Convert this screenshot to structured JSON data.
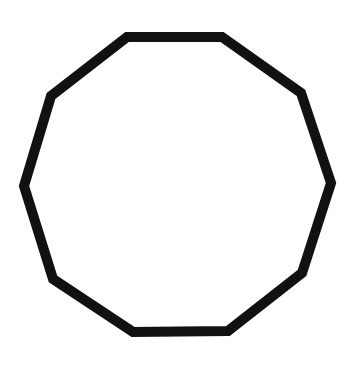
{
  "figure": {
    "shape": "decagon",
    "sides": 10,
    "stroke_color": "#111111",
    "stroke_width": 10,
    "fill_color": "#ffffff",
    "background": "#ffffff",
    "points": "127,37 222,37 301,93 331,183 302,273 228,331 133,332 53,279 24,186 51,96"
  }
}
